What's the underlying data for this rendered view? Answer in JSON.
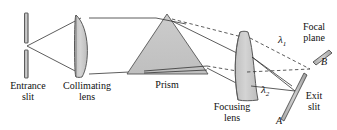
{
  "figure": {
    "type": "optical-spectrometer-diagram"
  },
  "labels": {
    "entrance_slit_line1": "Entrance",
    "entrance_slit_line2": "slit",
    "collimating_lens_line1": "Collimating",
    "collimating_lens_line2": "lens",
    "prism": "Prism",
    "focusing_lens_line1": "Focusing",
    "focusing_lens_line2": "lens",
    "focal_plane_line1": "Focal",
    "focal_plane_line2": "plane",
    "exit_slit_line1": "Exit",
    "exit_slit_line2": "slit",
    "lambda1": "λ",
    "lambda1_sub": "1",
    "lambda2": "λ",
    "lambda2_sub": "2",
    "point_a": "A",
    "point_b": "B"
  },
  "colors": {
    "ray_solid": "#333333",
    "ray_dashed": "#333333",
    "glass_fill": "#c9c9c9",
    "glass_stroke": "#4a4a4a",
    "prism_fill": "#c4c4c4",
    "prism_stroke": "#555555",
    "slit_fill": "#b8b8b8",
    "slit_stroke": "#3d3d3d",
    "text": "#111111",
    "background": "#ffffff"
  },
  "components": {
    "entrance_slit": {
      "name": "entrance-slit",
      "x": 26,
      "gap_center_y": 46
    },
    "collimating_lens": {
      "name": "collimating-lens",
      "x": 82,
      "top_y": 15,
      "bottom_y": 77
    },
    "prism": {
      "name": "prism",
      "apex_x": 167,
      "apex_y": 14,
      "left_x": 127,
      "right_x": 208,
      "base_y": 74
    },
    "focusing_lens": {
      "name": "focusing-lens",
      "center_x": 246,
      "top_y": 32,
      "bottom_y": 100
    },
    "exit_slit_upper": {
      "name": "exit-slit-bar-b",
      "label": "B"
    },
    "exit_slit_lower": {
      "name": "exit-slit-bar-a",
      "label": "A"
    }
  }
}
